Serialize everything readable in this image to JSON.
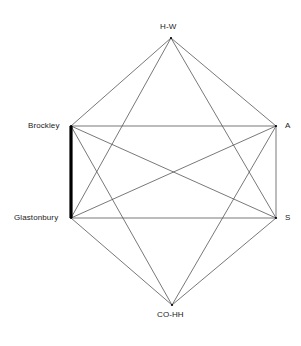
{
  "figure": {
    "title": "",
    "background_color": "#ffffff",
    "line_color": "#555555",
    "highlight_color": "#000000",
    "label_color": "#1a1a1a"
  },
  "chart_data": {
    "type": "diagram",
    "subtype": "complete-graph-hexagon",
    "title": "",
    "nodes": [
      {
        "id": "hw",
        "label": "H-W",
        "x": 171,
        "y": 38,
        "label_anchor": "top"
      },
      {
        "id": "a",
        "label": "A",
        "x": 276,
        "y": 126,
        "label_anchor": "right"
      },
      {
        "id": "s",
        "label": "S",
        "x": 276,
        "y": 218,
        "label_anchor": "right"
      },
      {
        "id": "cohh",
        "label": "CO-HH",
        "x": 172,
        "y": 305,
        "label_anchor": "bottom"
      },
      {
        "id": "glastonbury",
        "label": "Glastonbury",
        "x": 71,
        "y": 218,
        "label_anchor": "left"
      },
      {
        "id": "brockley",
        "label": "Brockley",
        "x": 71,
        "y": 126,
        "label_anchor": "left"
      }
    ],
    "edges": [
      {
        "from": "hw",
        "to": "a",
        "weight": "thin"
      },
      {
        "from": "hw",
        "to": "s",
        "weight": "thin"
      },
      {
        "from": "hw",
        "to": "glastonbury",
        "weight": "thin"
      },
      {
        "from": "hw",
        "to": "brockley",
        "weight": "thin"
      },
      {
        "from": "a",
        "to": "s",
        "weight": "thin"
      },
      {
        "from": "a",
        "to": "cohh",
        "weight": "thin"
      },
      {
        "from": "a",
        "to": "glastonbury",
        "weight": "thin"
      },
      {
        "from": "a",
        "to": "brockley",
        "weight": "thin"
      },
      {
        "from": "s",
        "to": "cohh",
        "weight": "thin"
      },
      {
        "from": "s",
        "to": "glastonbury",
        "weight": "thin"
      },
      {
        "from": "s",
        "to": "brockley",
        "weight": "thin"
      },
      {
        "from": "cohh",
        "to": "glastonbury",
        "weight": "thin"
      },
      {
        "from": "cohh",
        "to": "brockley",
        "weight": "thin"
      },
      {
        "from": "brockley",
        "to": "glastonbury",
        "weight": "thick"
      }
    ],
    "highlighted_edge": {
      "from": "brockley",
      "to": "glastonbury"
    }
  }
}
